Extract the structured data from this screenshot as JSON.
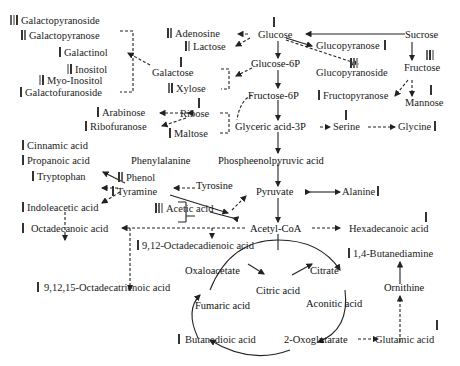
{
  "diagram": {
    "type": "metabolic-pathway",
    "nodes": {
      "galactopyranoside": {
        "label": "Galactopyranoside",
        "bars": 3
      },
      "galactopyranose": {
        "label": "Galactopyranose",
        "bars": 2
      },
      "galactinol": {
        "label": "Galactinol",
        "bars": 1
      },
      "inositol": {
        "label": "Inositol",
        "bars": 2
      },
      "myo_inositol": {
        "label": "Myo-Inositol",
        "bars": 2
      },
      "galactofuranoside": {
        "label": "Galactofuranoside",
        "bars": 1
      },
      "adenosine": {
        "label": "Adenosine",
        "bars": 2
      },
      "lactose": {
        "label": "Lactose",
        "bars": 2
      },
      "galactose": {
        "label": "Galactose",
        "bars": 1
      },
      "xylose": {
        "label": "Xylose",
        "bars": 2
      },
      "glucose": {
        "label": "Glucose",
        "bars": 1
      },
      "glucose_6p": {
        "label": "Glucose-6P"
      },
      "glucopyranose": {
        "label": "Glucopyranose",
        "bars": 1
      },
      "glucopyranoside": {
        "label": "Glucopyranoside",
        "bars": 3
      },
      "sucrose": {
        "label": "Sucrose"
      },
      "fructose": {
        "label": "Fructose",
        "bars": 3
      },
      "fructose_6p": {
        "label": "Fructose-6P"
      },
      "fructopyranose": {
        "label": "Fructopyranose",
        "bars": 1
      },
      "mannose": {
        "label": "Mannose",
        "bars": 1
      },
      "arabinose": {
        "label": "Arabinose",
        "bars": 1
      },
      "ribose": {
        "label": "Ribose",
        "bars": 1
      },
      "ribofuranose": {
        "label": "Ribofuranose",
        "bars": 1
      },
      "maltose": {
        "label": "Maltose",
        "bars": 1
      },
      "glyceric_acid_3p": {
        "label": "Glyceric acid-3P"
      },
      "serine": {
        "label": "Serine",
        "bars": 1
      },
      "glycine": {
        "label": "Glycine",
        "bars": 1
      },
      "cinnamic_acid": {
        "label": "Cinnamic acid",
        "bars": 1
      },
      "propanoic_acid": {
        "label": "Propanoic acid",
        "bars": 1
      },
      "phenylalanine": {
        "label": "Phenylalanine"
      },
      "phosphoenolpyruvic_acid": {
        "label": "Phospheenolpyruvic acid"
      },
      "tryptophan": {
        "label": "Tryptophan",
        "bars": 1
      },
      "phenol": {
        "label": "Phenol",
        "bars": 2
      },
      "tyramine": {
        "label": "Tyramine",
        "bars": 1
      },
      "tyrosine": {
        "label": "Tyrosine"
      },
      "indoleacetic_acid": {
        "label": "Indoleacetic acid",
        "bars": 1
      },
      "acetic_acid": {
        "label": "Acetic acid",
        "bars": 3
      },
      "pyruvate": {
        "label": "Pyruvate"
      },
      "alanine": {
        "label": "Alanine",
        "bars": 1
      },
      "octadecanoic_acid": {
        "label": "Octadecanoic acid",
        "bars": 1
      },
      "acetyl_coa": {
        "label": "Acetyl-CoA"
      },
      "hexadecanoic_acid": {
        "label": "Hexadecanoic acid",
        "bars": 1
      },
      "octadecadienoic_acid": {
        "label": "9,12-Octadecadienoic acid",
        "bars": 1
      },
      "butanediamine": {
        "label": "1,4-Butanediamine",
        "bars": 1
      },
      "octadecatrienoic_acid": {
        "label": "9,12,15-Octadecatrienoic acid",
        "bars": 1
      },
      "oxaloacetate": {
        "label": "Oxaloacetate"
      },
      "citrate": {
        "label": "Citrate"
      },
      "citric_acid": {
        "label": "Citric acid"
      },
      "fumaric_acid": {
        "label": "Fumaric acid"
      },
      "aconitic_acid": {
        "label": "Aconitic acid"
      },
      "ornithine": {
        "label": "Ornithine"
      },
      "butanedioic_acid": {
        "label": "Butanedioic acid",
        "bars": 1
      },
      "oxoglutarate": {
        "label": "2-Oxoglutarate"
      },
      "glutamic_acid": {
        "label": "Glutamic acid",
        "bars": 1
      }
    },
    "edge_styles": {
      "solid": "direct reaction",
      "dashed": "multi-step / indirect"
    },
    "colors": {
      "text": "#222222",
      "grey_text": "#555555",
      "bar_dark": "#333333",
      "bar_mid": "#666666",
      "bar_light": "#9a9a9a",
      "edge": "#222222"
    }
  }
}
